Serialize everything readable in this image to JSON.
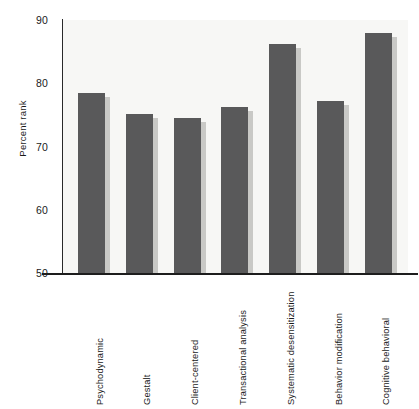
{
  "chart_data": {
    "type": "bar",
    "title": "",
    "xlabel": "",
    "ylabel": "Percent rank",
    "ylim": [
      50,
      90
    ],
    "yticks": [
      50,
      60,
      70,
      80,
      90
    ],
    "ytick_labels": [
      "50",
      "60",
      "70",
      "80",
      "90"
    ],
    "grid": false,
    "legend": null,
    "bar_color": "#59595a",
    "plot_background": "#f7f7f5",
    "categories": [
      "Psychodynamic",
      "Gestalt",
      "Client-centered",
      "Transactional analysis",
      "Systematic desensitization",
      "Behavior modification",
      "Cognitive behavioral"
    ],
    "values": [
      78.5,
      75.2,
      74.5,
      76.3,
      86.2,
      77.2,
      88.0
    ],
    "series": [
      {
        "name": "Percent rank",
        "values": [
          78.5,
          75.2,
          74.5,
          76.3,
          86.2,
          77.2,
          88.0
        ]
      }
    ]
  },
  "axis": {
    "y_title": "Percent rank",
    "ticks": [
      {
        "label": "90",
        "value": 90
      },
      {
        "label": "80",
        "value": 80
      },
      {
        "label": "70",
        "value": 70
      },
      {
        "label": "60",
        "value": 60
      },
      {
        "label": "50",
        "value": 50
      }
    ]
  },
  "bars": [
    {
      "label": "Psychodynamic",
      "value": 78.5
    },
    {
      "label": "Gestalt",
      "value": 75.2
    },
    {
      "label": "Client-centered",
      "value": 74.5
    },
    {
      "label": "Transactional analysis",
      "value": 76.3
    },
    {
      "label": "Systematic desensitization",
      "value": 86.2
    },
    {
      "label": "Behavior modification",
      "value": 77.2
    },
    {
      "label": "Cognitive behavioral",
      "value": 88.0
    }
  ]
}
